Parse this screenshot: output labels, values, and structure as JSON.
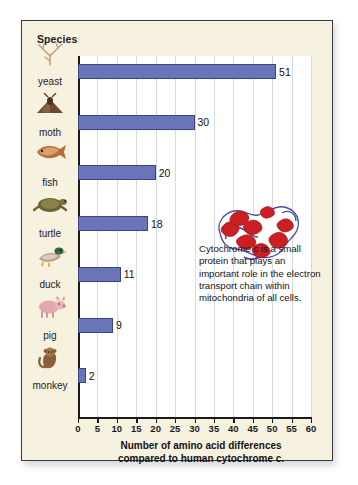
{
  "card": {
    "species_header": "Species",
    "background_color": "#f7f1e0",
    "border_color": "#3a3a3a"
  },
  "caption": {
    "lines": [
      "Cytochrome c is a small",
      "protein that plays an",
      "important role in the electron",
      "transport chain within",
      "mitochondria of all cells."
    ],
    "full_text": "Cytochrome c is a small protein that plays an important role in the electron transport chain within mitochondria of all cells."
  },
  "protein_figure": {
    "name": "cytochrome-c-ribbon-diagram",
    "helix_color": "#cc1f24",
    "loop_color": "#4a4fa0"
  },
  "chart_data": {
    "type": "bar",
    "orientation": "horizontal",
    "title": "",
    "xlabel": "Number of amino acid differences compared to human cytochrome c.",
    "ylabel": "Species",
    "xlim": [
      0,
      60
    ],
    "grid": true,
    "grid_interval": 5,
    "legend": "none",
    "bar_color": "#6a74b8",
    "bar_border_color": "#3c4480",
    "categories": [
      "yeast",
      "moth",
      "fish",
      "turtle",
      "duck",
      "pig",
      "monkey"
    ],
    "values": [
      51,
      30,
      20,
      18,
      11,
      9,
      2
    ],
    "tick_labels": [
      "0",
      "5",
      "10",
      "15",
      "20",
      "25",
      "30",
      "35",
      "40",
      "45",
      "50",
      "55",
      "60"
    ],
    "tick_values": [
      0,
      5,
      10,
      15,
      20,
      25,
      30,
      35,
      40,
      45,
      50,
      55,
      60
    ],
    "data_labels": [
      "51",
      "30",
      "20",
      "18",
      "11",
      "9",
      "2"
    ],
    "series": [
      {
        "name": "amino acid differences vs human cytochrome c",
        "values": [
          51,
          30,
          20,
          18,
          11,
          9,
          2
        ]
      }
    ]
  },
  "axis_title": {
    "line1": "Number of amino acid differences",
    "line2": "compared to human cytochrome c."
  }
}
